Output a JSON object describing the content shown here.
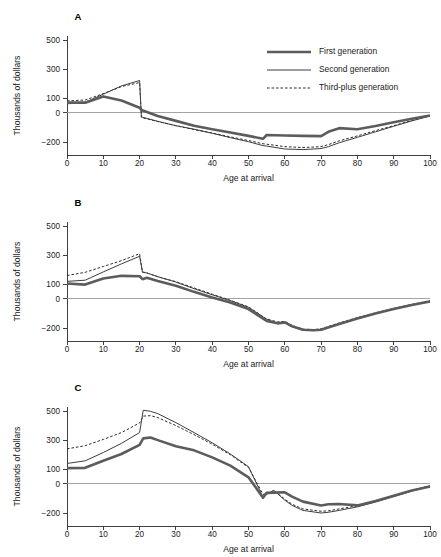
{
  "figure": {
    "panel_count": 3,
    "colors": {
      "first_generation": "#5c5c5c",
      "second_generation": "#3d3d3d",
      "third_plus_generation": "#2b2b2b",
      "axis": "#2b2b2b",
      "zero_line": "#9a9a9a",
      "background": "#ffffff"
    }
  },
  "legend": {
    "position": "top-right-panel-a",
    "entries": [
      {
        "key": "first",
        "label": "First generation",
        "style": "thick-solid"
      },
      {
        "key": "second",
        "label": "Second generation",
        "style": "thin-solid"
      },
      {
        "key": "third",
        "label": "Third-plus generation",
        "style": "dashed"
      }
    ]
  },
  "chart_data": [
    {
      "type": "line",
      "panel": "A",
      "title": "A",
      "xlabel": "Age at arrival",
      "ylabel": "Thousands of dollars",
      "xlim": [
        0,
        100
      ],
      "ylim": [
        -280,
        560
      ],
      "xticks": [
        0,
        10,
        20,
        30,
        40,
        50,
        60,
        70,
        80,
        90,
        100
      ],
      "yticks": [
        -200,
        0,
        100,
        300,
        500
      ],
      "grid": false,
      "x": [
        0,
        5,
        10,
        15,
        20,
        20.5,
        25,
        30,
        35,
        40,
        45,
        50,
        54,
        55,
        60,
        65,
        70,
        72,
        75,
        80,
        85,
        90,
        95,
        100
      ],
      "series": [
        {
          "name": "First generation",
          "values": [
            70,
            70,
            112,
            85,
            35,
            20,
            -22,
            -55,
            -88,
            -112,
            -135,
            -158,
            -178,
            -152,
            -155,
            -158,
            -160,
            -130,
            -105,
            -112,
            -90,
            -65,
            -40,
            -18
          ]
        },
        {
          "name": "Second generation",
          "values": [
            62,
            72,
            128,
            185,
            222,
            -28,
            -58,
            -88,
            -112,
            -140,
            -170,
            -198,
            -225,
            -228,
            -248,
            -252,
            -245,
            -232,
            -205,
            -168,
            -130,
            -92,
            -55,
            -22
          ]
        },
        {
          "name": "Third-plus generation",
          "values": [
            82,
            88,
            132,
            180,
            208,
            -32,
            -60,
            -88,
            -115,
            -138,
            -165,
            -190,
            -212,
            -215,
            -232,
            -238,
            -232,
            -218,
            -192,
            -158,
            -122,
            -88,
            -52,
            -20
          ]
        }
      ]
    },
    {
      "type": "line",
      "panel": "B",
      "title": "B",
      "xlabel": "Age at arrival",
      "ylabel": "Thousands of dollars",
      "xlim": [
        0,
        100
      ],
      "ylim": [
        -280,
        560
      ],
      "xticks": [
        0,
        10,
        20,
        30,
        40,
        50,
        60,
        70,
        80,
        90,
        100
      ],
      "yticks": [
        -200,
        0,
        100,
        300,
        500
      ],
      "grid": false,
      "x": [
        0,
        5,
        10,
        15,
        20,
        20.8,
        22,
        25,
        30,
        35,
        40,
        45,
        50,
        55,
        58,
        60,
        62,
        65,
        68,
        70,
        75,
        80,
        85,
        90,
        95,
        100
      ],
      "series": [
        {
          "name": "First generation",
          "values": [
            105,
            98,
            140,
            158,
            155,
            135,
            145,
            122,
            90,
            48,
            10,
            -25,
            -70,
            -152,
            -168,
            -162,
            -188,
            -212,
            -215,
            -212,
            -172,
            -135,
            -100,
            -70,
            -42,
            -18
          ]
        },
        {
          "name": "Second generation",
          "values": [
            120,
            128,
            185,
            240,
            292,
            182,
            178,
            152,
            115,
            70,
            28,
            -12,
            -58,
            -140,
            -168,
            -160,
            -190,
            -215,
            -218,
            -210,
            -170,
            -132,
            -98,
            -68,
            -40,
            -15
          ]
        },
        {
          "name": "Third-plus generation",
          "values": [
            160,
            182,
            222,
            262,
            310,
            185,
            178,
            152,
            118,
            75,
            32,
            -10,
            -55,
            -138,
            -158,
            -155,
            -182,
            -208,
            -212,
            -205,
            -165,
            -128,
            -95,
            -65,
            -38,
            -12
          ]
        }
      ]
    },
    {
      "type": "line",
      "panel": "C",
      "title": "C",
      "xlabel": "Age at arrival",
      "ylabel": "Thousands of dollars",
      "xlim": [
        0,
        100
      ],
      "ylim": [
        -280,
        560
      ],
      "xticks": [
        0,
        10,
        20,
        30,
        40,
        50,
        60,
        70,
        80,
        90,
        100
      ],
      "yticks": [
        -200,
        0,
        100,
        300,
        500
      ],
      "grid": false,
      "x": [
        0,
        5,
        10,
        15,
        20,
        21,
        23,
        25,
        30,
        35,
        40,
        45,
        50,
        54,
        55,
        57,
        60,
        62,
        65,
        70,
        72,
        75,
        80,
        85,
        90,
        95,
        100
      ],
      "series": [
        {
          "name": "First generation",
          "values": [
            108,
            110,
            158,
            205,
            268,
            312,
            318,
            300,
            258,
            230,
            182,
            125,
            45,
            -95,
            -62,
            -60,
            -58,
            -88,
            -122,
            -148,
            -140,
            -138,
            -148,
            -118,
            -82,
            -45,
            -18
          ]
        },
        {
          "name": "Second generation",
          "values": [
            140,
            158,
            215,
            278,
            352,
            505,
            498,
            482,
            420,
            352,
            282,
            205,
            118,
            -92,
            -72,
            -45,
            -112,
            -148,
            -182,
            -200,
            -195,
            -182,
            -158,
            -125,
            -88,
            -50,
            -15
          ]
        },
        {
          "name": "Third-plus generation",
          "values": [
            240,
            262,
            305,
            352,
            418,
            465,
            468,
            455,
            400,
            338,
            272,
            200,
            112,
            -72,
            -68,
            -45,
            -105,
            -140,
            -172,
            -188,
            -185,
            -172,
            -150,
            -118,
            -82,
            -45,
            -12
          ]
        }
      ]
    }
  ]
}
